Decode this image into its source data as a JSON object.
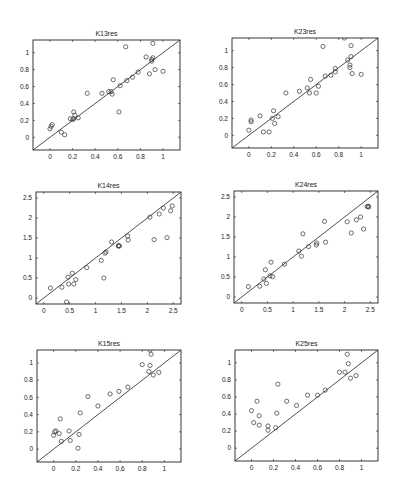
{
  "figure": {
    "background": "#ffffff",
    "axis_color": "#222222",
    "marker_color": "#333333",
    "line_color": "#222222"
  },
  "chart_data": [
    {
      "type": "scatter",
      "title": "K13res",
      "xlabel": "",
      "ylabel": "",
      "xlim": [
        -0.15,
        1.15
      ],
      "ylim": [
        -0.15,
        1.15
      ],
      "xticks": [
        0,
        0.2,
        0.4,
        0.6,
        0.8,
        1
      ],
      "yticks": [
        0,
        0.2,
        0.4,
        0.6,
        0.8,
        1
      ],
      "xtick_labels": [
        "0",
        "0.2",
        "0.4",
        "0.6",
        "0.8",
        "1"
      ],
      "ytick_labels": [
        "0",
        "0.2",
        "0.4",
        "0.6",
        "0.8",
        "1"
      ],
      "grid": false,
      "reference_line": "y=x",
      "box": {
        "x": 33,
        "y": 40,
        "w": 147,
        "h": 110
      },
      "points": [
        [
          0.0,
          0.1
        ],
        [
          0.01,
          0.13
        ],
        [
          0.02,
          0.15
        ],
        [
          0.1,
          0.06
        ],
        [
          0.13,
          0.03
        ],
        [
          0.18,
          0.22
        ],
        [
          0.2,
          0.21
        ],
        [
          0.21,
          0.22
        ],
        [
          0.21,
          0.3
        ],
        [
          0.22,
          0.26
        ],
        [
          0.25,
          0.23
        ],
        [
          0.33,
          0.52
        ],
        [
          0.46,
          0.52
        ],
        [
          0.52,
          0.54
        ],
        [
          0.54,
          0.54
        ],
        [
          0.55,
          0.51
        ],
        [
          0.56,
          0.68
        ],
        [
          0.61,
          0.3
        ],
        [
          0.62,
          0.61
        ],
        [
          0.67,
          1.07
        ],
        [
          0.68,
          0.67
        ],
        [
          0.73,
          0.71
        ],
        [
          0.78,
          0.77
        ],
        [
          0.85,
          0.95
        ],
        [
          0.88,
          0.75
        ],
        [
          0.9,
          0.92
        ],
        [
          0.9,
          0.9
        ],
        [
          0.91,
          0.94
        ],
        [
          0.91,
          1.11
        ],
        [
          0.93,
          0.8
        ],
        [
          1.0,
          0.78
        ]
      ]
    },
    {
      "type": "scatter",
      "title": "K23res",
      "xlabel": "",
      "ylabel": "",
      "xlim": [
        -0.15,
        1.15
      ],
      "ylim": [
        -0.15,
        1.15
      ],
      "xticks": [
        0,
        0.2,
        0.4,
        0.6,
        0.8,
        1
      ],
      "yticks": [
        0,
        0.2,
        0.4,
        0.6,
        0.8,
        1
      ],
      "xtick_labels": [
        "0",
        "0.2",
        "0.4",
        "0.6",
        "0.8",
        "1"
      ],
      "ytick_labels": [
        "0",
        "0.2",
        "0.4",
        "0.6",
        "0.8",
        "1"
      ],
      "grid": false,
      "reference_line": "y=x",
      "box": {
        "x": 232,
        "y": 38,
        "w": 146,
        "h": 110
      },
      "points": [
        [
          0.0,
          0.06
        ],
        [
          0.02,
          0.16
        ],
        [
          0.02,
          0.18
        ],
        [
          0.1,
          0.23
        ],
        [
          0.13,
          0.04
        ],
        [
          0.18,
          0.04
        ],
        [
          0.21,
          0.2
        ],
        [
          0.22,
          0.29
        ],
        [
          0.23,
          0.14
        ],
        [
          0.26,
          0.22
        ],
        [
          0.33,
          0.5
        ],
        [
          0.45,
          0.52
        ],
        [
          0.52,
          0.56
        ],
        [
          0.54,
          0.5
        ],
        [
          0.55,
          0.66
        ],
        [
          0.6,
          0.5
        ],
        [
          0.62,
          0.58
        ],
        [
          0.66,
          1.05
        ],
        [
          0.68,
          0.7
        ],
        [
          0.73,
          0.71
        ],
        [
          0.77,
          0.75
        ],
        [
          0.77,
          0.79
        ],
        [
          0.85,
          1.15
        ],
        [
          0.88,
          0.89
        ],
        [
          0.9,
          0.83
        ],
        [
          0.9,
          0.8
        ],
        [
          0.91,
          0.93
        ],
        [
          0.91,
          1.06
        ],
        [
          0.92,
          0.73
        ],
        [
          1.0,
          0.72
        ]
      ]
    },
    {
      "type": "scatter",
      "title": "K14res",
      "xlabel": "",
      "ylabel": "",
      "xlim": [
        -0.15,
        2.65
      ],
      "ylim": [
        -0.15,
        2.65
      ],
      "xticks": [
        0,
        0.5,
        1,
        1.5,
        2,
        2.5
      ],
      "yticks": [
        0,
        0.5,
        1,
        1.5,
        2,
        2.5
      ],
      "xtick_labels": [
        "0",
        "0.5",
        "1",
        "1.5",
        "2",
        "2.5"
      ],
      "ytick_labels": [
        "0",
        "0.5",
        "1",
        "1.5",
        "2",
        "2.5"
      ],
      "grid": false,
      "reference_line": "y=x",
      "box": {
        "x": 36,
        "y": 192,
        "w": 145,
        "h": 112
      },
      "points": [
        [
          0.13,
          0.25
        ],
        [
          0.35,
          0.27
        ],
        [
          0.44,
          -0.1
        ],
        [
          0.47,
          0.52
        ],
        [
          0.48,
          0.35
        ],
        [
          0.55,
          0.62
        ],
        [
          0.58,
          0.35
        ],
        [
          0.62,
          0.46
        ],
        [
          0.83,
          0.76
        ],
        [
          1.11,
          0.94
        ],
        [
          1.16,
          0.5
        ],
        [
          1.18,
          1.12
        ],
        [
          1.2,
          1.15
        ],
        [
          1.31,
          1.4
        ],
        [
          1.44,
          1.3
        ],
        [
          1.45,
          1.31
        ],
        [
          1.46,
          1.3
        ],
        [
          1.62,
          1.55
        ],
        [
          1.63,
          1.45
        ],
        [
          2.05,
          2.02
        ],
        [
          2.13,
          1.46
        ],
        [
          2.23,
          2.1
        ],
        [
          2.31,
          2.25
        ],
        [
          2.38,
          1.51
        ],
        [
          2.45,
          2.18
        ],
        [
          2.48,
          2.3
        ]
      ]
    },
    {
      "type": "scatter",
      "title": "K24res",
      "xlabel": "",
      "ylabel": "",
      "xlim": [
        -0.15,
        2.65
      ],
      "ylim": [
        -0.15,
        2.65
      ],
      "xticks": [
        0,
        0.5,
        1,
        1.5,
        2,
        2.5
      ],
      "yticks": [
        0,
        0.5,
        1,
        1.5,
        2,
        2.5
      ],
      "xtick_labels": [
        "0",
        "0.5",
        "1",
        "1.5",
        "2",
        "2.5"
      ],
      "ytick_labels": [
        "0",
        "0.5",
        "1",
        "1.5",
        "2",
        "2.5"
      ],
      "grid": false,
      "reference_line": "y=x",
      "box": {
        "x": 234,
        "y": 191,
        "w": 144,
        "h": 112
      },
      "points": [
        [
          0.13,
          0.26
        ],
        [
          0.35,
          0.27
        ],
        [
          0.43,
          0.45
        ],
        [
          0.46,
          0.68
        ],
        [
          0.48,
          0.34
        ],
        [
          0.55,
          0.53
        ],
        [
          0.57,
          0.87
        ],
        [
          0.6,
          0.51
        ],
        [
          0.83,
          0.82
        ],
        [
          1.11,
          1.15
        ],
        [
          1.16,
          1.02
        ],
        [
          1.19,
          1.58
        ],
        [
          1.3,
          1.26
        ],
        [
          1.45,
          1.3
        ],
        [
          1.46,
          1.35
        ],
        [
          1.61,
          1.89
        ],
        [
          1.63,
          1.37
        ],
        [
          2.05,
          1.88
        ],
        [
          2.13,
          1.6
        ],
        [
          2.23,
          1.93
        ],
        [
          2.31,
          2.0
        ],
        [
          2.37,
          1.7
        ],
        [
          2.44,
          2.26
        ],
        [
          2.46,
          2.27
        ],
        [
          2.47,
          2.25
        ]
      ]
    },
    {
      "type": "scatter",
      "title": "K15res",
      "xlabel": "",
      "ylabel": "",
      "xlim": [
        -0.15,
        1.15
      ],
      "ylim": [
        -0.15,
        1.15
      ],
      "xticks": [
        0,
        0.2,
        0.4,
        0.6,
        0.8,
        1
      ],
      "yticks": [
        0,
        0.2,
        0.4,
        0.6,
        0.8,
        1
      ],
      "xtick_labels": [
        "0",
        "0.2",
        "0.4",
        "0.6",
        "0.8",
        "1"
      ],
      "ytick_labels": [
        "0",
        "0.2",
        "0.4",
        "0.6",
        "0.8",
        "1"
      ],
      "grid": false,
      "reference_line": "y=x",
      "box": {
        "x": 37,
        "y": 350,
        "w": 144,
        "h": 112
      },
      "points": [
        [
          0.0,
          0.16
        ],
        [
          0.01,
          0.2
        ],
        [
          0.02,
          0.21
        ],
        [
          0.05,
          0.18
        ],
        [
          0.06,
          0.35
        ],
        [
          0.07,
          0.09
        ],
        [
          0.14,
          0.21
        ],
        [
          0.15,
          0.1
        ],
        [
          0.22,
          0.01
        ],
        [
          0.23,
          0.17
        ],
        [
          0.24,
          0.42
        ],
        [
          0.31,
          0.61
        ],
        [
          0.4,
          0.5
        ],
        [
          0.51,
          0.64
        ],
        [
          0.59,
          0.67
        ],
        [
          0.67,
          0.72
        ],
        [
          0.8,
          0.98
        ],
        [
          0.86,
          0.9
        ],
        [
          0.87,
          0.97
        ],
        [
          0.87,
          1.15
        ],
        [
          0.88,
          1.1
        ],
        [
          0.9,
          0.86
        ],
        [
          0.95,
          0.89
        ]
      ]
    },
    {
      "type": "scatter",
      "title": "K25res",
      "xlabel": "",
      "ylabel": "",
      "xlim": [
        -0.15,
        1.15
      ],
      "ylim": [
        -0.15,
        1.15
      ],
      "xticks": [
        0,
        0.2,
        0.4,
        0.6,
        0.8,
        1
      ],
      "yticks": [
        0,
        0.2,
        0.4,
        0.6,
        0.8,
        1
      ],
      "xtick_labels": [
        "0",
        "0.2",
        "0.4",
        "0.6",
        "0.8",
        "1"
      ],
      "ytick_labels": [
        "0",
        "0.2",
        "0.4",
        "0.6",
        "0.8",
        "1"
      ],
      "grid": false,
      "reference_line": "y=x",
      "box": {
        "x": 235,
        "y": 350,
        "w": 143,
        "h": 111
      },
      "points": [
        [
          0.0,
          0.44
        ],
        [
          0.02,
          0.3
        ],
        [
          0.05,
          0.55
        ],
        [
          0.07,
          0.27
        ],
        [
          0.07,
          0.38
        ],
        [
          0.15,
          0.26
        ],
        [
          0.15,
          0.21
        ],
        [
          0.22,
          0.24
        ],
        [
          0.23,
          0.41
        ],
        [
          0.24,
          0.75
        ],
        [
          0.32,
          0.55
        ],
        [
          0.41,
          0.5
        ],
        [
          0.51,
          0.62
        ],
        [
          0.6,
          0.62
        ],
        [
          0.67,
          0.68
        ],
        [
          0.8,
          0.89
        ],
        [
          0.85,
          0.89
        ],
        [
          0.87,
          1.1
        ],
        [
          0.88,
          0.99
        ],
        [
          0.9,
          0.82
        ],
        [
          0.95,
          0.85
        ]
      ]
    }
  ]
}
